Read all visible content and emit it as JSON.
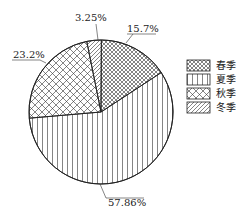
{
  "chart_data": {
    "type": "pie",
    "title": "",
    "categories": [
      "春季",
      "夏季",
      "秋季",
      "冬季"
    ],
    "values": [
      15.7,
      57.86,
      23.2,
      3.25
    ],
    "value_labels": [
      "15.7%",
      "57.86%",
      "23.2%",
      "3.25%"
    ],
    "patterns": [
      "fine-crosshatch",
      "vertical-lines",
      "diamond-crosshatch",
      "diagonal-lines"
    ],
    "start_angle": "12 o'clock",
    "direction": "clockwise",
    "legend_position": "right"
  },
  "labels": {
    "spring": "15.7%",
    "summer": "57.86%",
    "autumn": "23.2%",
    "winter": "3.25%"
  },
  "legend": [
    "春季",
    "夏季",
    "秋季",
    "冬季"
  ]
}
